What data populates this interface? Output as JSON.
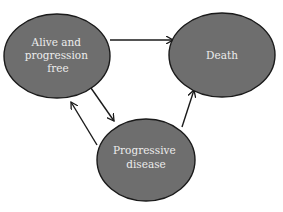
{
  "diagram": {
    "type": "state-transition",
    "colors": {
      "node_fill": "#6e6e6e",
      "node_stroke": "#1a1a1a",
      "edge": "#1a1a1a",
      "label": "#ececec",
      "background": "#ffffff"
    },
    "nodes": [
      {
        "id": "alive",
        "label_lines": [
          "Alive and",
          "progression",
          "free"
        ]
      },
      {
        "id": "death",
        "label_lines": [
          "Death"
        ]
      },
      {
        "id": "progressive",
        "label_lines": [
          "Progressive",
          "disease"
        ]
      }
    ],
    "edges": [
      {
        "from": "alive",
        "to": "death"
      },
      {
        "from": "alive",
        "to": "progressive"
      },
      {
        "from": "progressive",
        "to": "alive"
      },
      {
        "from": "progressive",
        "to": "death"
      }
    ]
  }
}
